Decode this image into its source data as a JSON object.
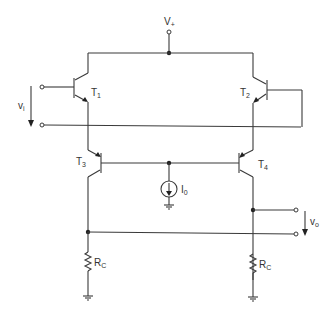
{
  "diagram": {
    "type": "circuit-schematic",
    "supply": {
      "label": "V",
      "sub": "+"
    },
    "input": {
      "label": "v",
      "sub": "i"
    },
    "output": {
      "label": "v",
      "sub": "o"
    },
    "transistors": [
      {
        "id": "T1",
        "label": "T",
        "sub": "1"
      },
      {
        "id": "T2",
        "label": "T",
        "sub": "2"
      },
      {
        "id": "T3",
        "label": "T",
        "sub": "3"
      },
      {
        "id": "T4",
        "label": "T",
        "sub": "4"
      }
    ],
    "current_source": {
      "label": "I",
      "sub": "0"
    },
    "resistors": [
      {
        "id": "RC_left",
        "label": "R",
        "sub": "C"
      },
      {
        "id": "RC_right",
        "label": "R",
        "sub": "C"
      }
    ],
    "colors": {
      "wire": "#3a3a3a",
      "background": "#ffffff"
    }
  }
}
